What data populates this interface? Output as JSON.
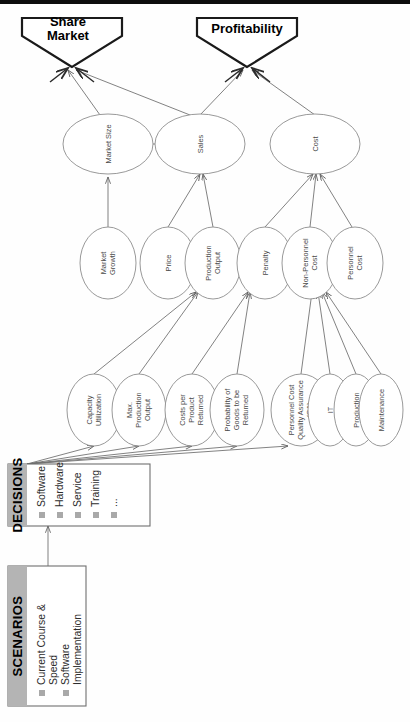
{
  "diagram": {
    "goals": [
      {
        "id": "market-share",
        "label": "Market Share",
        "line1": "Market",
        "line2": "Share"
      },
      {
        "id": "profitability",
        "label": "Profitability",
        "line1": "Profitability",
        "line2": ""
      }
    ],
    "level2": [
      {
        "id": "market-size",
        "label": "Market Size",
        "lines": [
          "Market Size"
        ]
      },
      {
        "id": "sales",
        "label": "Sales",
        "lines": [
          "Sales"
        ]
      },
      {
        "id": "cost",
        "label": "Cost",
        "lines": [
          "Cost"
        ]
      }
    ],
    "level3": [
      {
        "id": "market-growth",
        "label": "Market Growth",
        "lines": [
          "Market",
          "Growth"
        ]
      },
      {
        "id": "price",
        "label": "Price",
        "lines": [
          "Price"
        ]
      },
      {
        "id": "production-output",
        "label": "Production Output",
        "lines": [
          "Production",
          "Output"
        ]
      },
      {
        "id": "penalty",
        "label": "Penalty",
        "lines": [
          "Penalty"
        ]
      },
      {
        "id": "non-personnel-cost",
        "label": "Non-Personnel Cost",
        "lines": [
          "Non-Personnel",
          "Cost"
        ]
      },
      {
        "id": "personnel-cost",
        "label": "Personnel Cost",
        "lines": [
          "Personnel",
          "Cost"
        ]
      }
    ],
    "level4": [
      {
        "id": "capacity-utilization",
        "label": "Capacity Utilization",
        "lines": [
          "Capacity",
          "Utilization"
        ]
      },
      {
        "id": "max-production-output",
        "label": "Max. Production Output",
        "lines": [
          "Max.",
          "Production",
          "Output"
        ]
      },
      {
        "id": "costs-per-product-returned",
        "label": "Costs per Product Returned",
        "lines": [
          "Costs per",
          "Product",
          "Returned"
        ]
      },
      {
        "id": "probability-goods-returned",
        "label": "Probability of Goods to be Returned",
        "lines": [
          "Probability of",
          "Goods to be",
          "Returned"
        ]
      },
      {
        "id": "personnel-cost-qa",
        "label": "Personnel Cost Quality Assurance (QA)",
        "lines": [
          "Personnel Cost",
          "Quality Assurance",
          "(QA)"
        ]
      },
      {
        "id": "it",
        "label": "IT",
        "lines": [
          "IT"
        ]
      },
      {
        "id": "production",
        "label": "Production",
        "lines": [
          "Production"
        ]
      },
      {
        "id": "maintenance",
        "label": "Maintenance",
        "lines": [
          "Maintenance"
        ]
      }
    ],
    "panels": [
      {
        "id": "scenarios",
        "title": "SCENARIOS",
        "items": [
          "Current Course & Speed",
          "Software Implementation"
        ],
        "item_lines": [
          [
            "Current Course &",
            "Speed"
          ],
          [
            "Software",
            "Implementation"
          ]
        ]
      },
      {
        "id": "decisions",
        "title": "DECISIONS",
        "items": [
          "Software",
          "Hardware",
          "Service",
          "Training",
          "..."
        ],
        "item_lines": [
          [
            "Software"
          ],
          [
            "Hardware"
          ],
          [
            "Service"
          ],
          [
            "Training"
          ],
          [
            "..."
          ]
        ]
      }
    ],
    "colors": {
      "band": "#b4b4b4",
      "goal_stroke": "#1a1a1a",
      "node_stroke": "#8d8d8d",
      "edge": "#6b6b6b",
      "bullet": "#a9a9a9"
    }
  }
}
